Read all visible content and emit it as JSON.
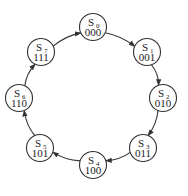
{
  "diagram": {
    "type": "state-diagram",
    "nodes": [
      {
        "id": "S0",
        "name": "S",
        "sub": "0",
        "code": "000",
        "cx": 93,
        "cy": 27
      },
      {
        "id": "S1",
        "name": "S",
        "sub": "1",
        "code": "001",
        "cx": 147,
        "cy": 52
      },
      {
        "id": "S2",
        "name": "S",
        "sub": "2",
        "code": "010",
        "cx": 163,
        "cy": 98
      },
      {
        "id": "S3",
        "name": "S",
        "sub": "3",
        "code": "011",
        "cx": 143,
        "cy": 148
      },
      {
        "id": "S4",
        "name": "S",
        "sub": "4",
        "code": "100",
        "cx": 93,
        "cy": 165
      },
      {
        "id": "S5",
        "name": "S",
        "sub": "5",
        "code": "101",
        "cx": 40,
        "cy": 148
      },
      {
        "id": "S6",
        "name": "S",
        "sub": "6",
        "code": "110",
        "cx": 19,
        "cy": 98
      },
      {
        "id": "S7",
        "name": "S",
        "sub": "7",
        "code": "111",
        "cx": 41,
        "cy": 52
      }
    ],
    "edges": [
      {
        "from": "S0",
        "to": "S1"
      },
      {
        "from": "S1",
        "to": "S2"
      },
      {
        "from": "S2",
        "to": "S3"
      },
      {
        "from": "S3",
        "to": "S4"
      },
      {
        "from": "S4",
        "to": "S5"
      },
      {
        "from": "S5",
        "to": "S6"
      },
      {
        "from": "S6",
        "to": "S7"
      },
      {
        "from": "S7",
        "to": "S0"
      }
    ]
  }
}
